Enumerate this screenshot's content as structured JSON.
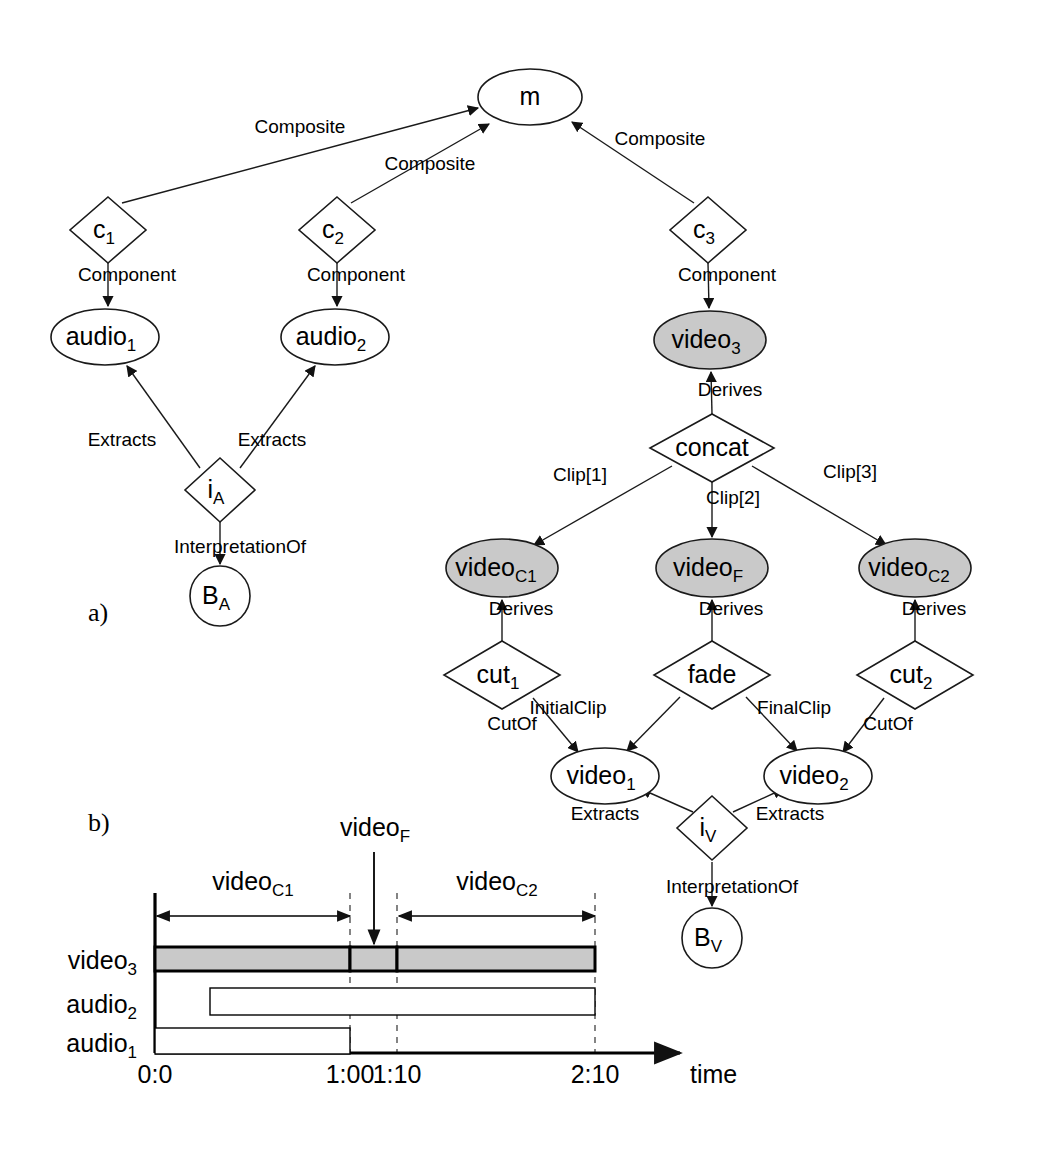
{
  "figure": {
    "panels": [
      {
        "id": "a",
        "label": "a)",
        "x": 88,
        "y": 598
      },
      {
        "id": "b",
        "label": "b)",
        "x": 88,
        "y": 808
      }
    ],
    "colors": {
      "stroke": "#1a1a1a",
      "node_fill_white": "#ffffff",
      "node_fill_gray": "#c9c9c9",
      "background": "#ffffff"
    }
  },
  "graph": {
    "nodes": [
      {
        "name": "m",
        "kind": "ellipse",
        "label": "m",
        "sub": "",
        "cx": 530,
        "cy": 97,
        "rx": 52,
        "ry": 28,
        "fill": "white"
      },
      {
        "name": "c1",
        "kind": "diamond",
        "label": "c",
        "sub": "1",
        "cx": 108,
        "cy": 230,
        "rx": 38,
        "ry": 33,
        "fill": "white"
      },
      {
        "name": "c2",
        "kind": "diamond",
        "label": "c",
        "sub": "2",
        "cx": 337,
        "cy": 230,
        "rx": 38,
        "ry": 33,
        "fill": "white"
      },
      {
        "name": "c3",
        "kind": "diamond",
        "label": "c",
        "sub": "3",
        "cx": 708,
        "cy": 230,
        "rx": 38,
        "ry": 33,
        "fill": "white"
      },
      {
        "name": "audio1",
        "kind": "ellipse",
        "label": "audio",
        "sub": "1",
        "cx": 105,
        "cy": 337,
        "rx": 54,
        "ry": 28,
        "fill": "white"
      },
      {
        "name": "audio2",
        "kind": "ellipse",
        "label": "audio",
        "sub": "2",
        "cx": 335,
        "cy": 337,
        "rx": 54,
        "ry": 28,
        "fill": "white"
      },
      {
        "name": "video3",
        "kind": "ellipse",
        "label": "video",
        "sub": "3",
        "cx": 710,
        "cy": 340,
        "rx": 56,
        "ry": 29,
        "fill": "gray"
      },
      {
        "name": "iA",
        "kind": "diamond",
        "label": "i",
        "sub": "A",
        "cx": 220,
        "cy": 490,
        "rx": 35,
        "ry": 32,
        "fill": "white"
      },
      {
        "name": "BA",
        "kind": "circle",
        "label": "B",
        "sub": "A",
        "cx": 220,
        "cy": 596,
        "rx": 30,
        "ry": 30,
        "fill": "white"
      },
      {
        "name": "concat",
        "kind": "diamond",
        "label": "concat",
        "sub": "",
        "cx": 712,
        "cy": 448,
        "rx": 62,
        "ry": 34,
        "fill": "white"
      },
      {
        "name": "videoC1",
        "kind": "ellipse",
        "label": "video",
        "sub": "C1",
        "cx": 502,
        "cy": 568,
        "rx": 56,
        "ry": 29,
        "fill": "gray"
      },
      {
        "name": "videoF",
        "kind": "ellipse",
        "label": "video",
        "sub": "F",
        "cx": 712,
        "cy": 568,
        "rx": 56,
        "ry": 29,
        "fill": "gray"
      },
      {
        "name": "videoC2",
        "kind": "ellipse",
        "label": "video",
        "sub": "C2",
        "cx": 915,
        "cy": 568,
        "rx": 56,
        "ry": 29,
        "fill": "gray"
      },
      {
        "name": "cut1",
        "kind": "diamond",
        "label": "cut",
        "sub": "1",
        "cx": 502,
        "cy": 675,
        "rx": 58,
        "ry": 34,
        "fill": "white"
      },
      {
        "name": "fade",
        "kind": "diamond",
        "label": "fade",
        "sub": "",
        "cx": 712,
        "cy": 675,
        "rx": 58,
        "ry": 34,
        "fill": "white"
      },
      {
        "name": "cut2",
        "kind": "diamond",
        "label": "cut",
        "sub": "2",
        "cx": 915,
        "cy": 675,
        "rx": 58,
        "ry": 34,
        "fill": "white"
      },
      {
        "name": "video1",
        "kind": "ellipse",
        "label": "video",
        "sub": "1",
        "cx": 605,
        "cy": 776,
        "rx": 54,
        "ry": 28,
        "fill": "white"
      },
      {
        "name": "video2",
        "kind": "ellipse",
        "label": "video",
        "sub": "2",
        "cx": 818,
        "cy": 776,
        "rx": 54,
        "ry": 28,
        "fill": "white"
      },
      {
        "name": "iV",
        "kind": "diamond",
        "label": "i",
        "sub": "V",
        "cx": 712,
        "cy": 828,
        "rx": 35,
        "ry": 32,
        "fill": "white"
      },
      {
        "name": "BV",
        "kind": "circle",
        "label": "B",
        "sub": "V",
        "cx": 712,
        "cy": 938,
        "rx": 30,
        "ry": 30,
        "fill": "white"
      }
    ],
    "edges": [
      {
        "from": "c1",
        "to": "m",
        "label": "Composite",
        "lx": 300,
        "ly": 133,
        "x1": 122,
        "y1": 203,
        "x2": 478,
        "y2": 108
      },
      {
        "from": "c2",
        "to": "m",
        "label": "Composite",
        "lx": 430,
        "ly": 170,
        "x1": 351,
        "y1": 203,
        "x2": 489,
        "y2": 124
      },
      {
        "from": "c3",
        "to": "m",
        "label": "Composite",
        "lx": 660,
        "ly": 145,
        "x1": 694,
        "y1": 203,
        "x2": 572,
        "y2": 122
      },
      {
        "from": "c1",
        "to": "audio1",
        "label": "Component",
        "lx": 127,
        "ly": 281,
        "x1": 108,
        "y1": 263,
        "x2": 108,
        "y2": 306
      },
      {
        "from": "c2",
        "to": "audio2",
        "label": "Component",
        "lx": 356,
        "ly": 281,
        "x1": 337,
        "y1": 263,
        "x2": 337,
        "y2": 306
      },
      {
        "from": "c3",
        "to": "video3",
        "label": "Component",
        "lx": 727,
        "ly": 281,
        "x1": 708,
        "y1": 263,
        "x2": 709,
        "y2": 308
      },
      {
        "from": "iA",
        "to": "audio1",
        "label": "Extracts",
        "lx": 122,
        "ly": 446,
        "x1": 200,
        "y1": 468,
        "x2": 127,
        "y2": 366
      },
      {
        "from": "iA",
        "to": "audio2",
        "label": "Extracts",
        "lx": 272,
        "ly": 446,
        "x1": 240,
        "y1": 468,
        "x2": 315,
        "y2": 366
      },
      {
        "from": "iA",
        "to": "BA",
        "label": "InterpretationOf",
        "lx": 240,
        "ly": 553,
        "x1": 220,
        "y1": 522,
        "x2": 220,
        "y2": 564
      },
      {
        "from": "concat",
        "to": "video3",
        "label": "Derives",
        "lx": 730,
        "ly": 396,
        "x1": 712,
        "y1": 414,
        "x2": 711,
        "y2": 372
      },
      {
        "from": "concat",
        "to": "videoC1",
        "label": "Clip[1]",
        "lx": 580,
        "ly": 481,
        "x1": 672,
        "y1": 466,
        "x2": 534,
        "y2": 545
      },
      {
        "from": "concat",
        "to": "videoF",
        "label": "Clip[2]",
        "lx": 733,
        "ly": 504,
        "x1": 712,
        "y1": 482,
        "x2": 712,
        "y2": 537
      },
      {
        "from": "concat",
        "to": "videoC2",
        "label": "Clip[3]",
        "lx": 850,
        "ly": 478,
        "x1": 752,
        "y1": 466,
        "x2": 886,
        "y2": 545
      },
      {
        "from": "cut1",
        "to": "videoC1",
        "label": "Derives",
        "lx": 521,
        "ly": 615,
        "x1": 502,
        "y1": 641,
        "x2": 502,
        "y2": 600
      },
      {
        "from": "fade",
        "to": "videoF",
        "label": "Derives",
        "lx": 731,
        "ly": 615,
        "x1": 712,
        "y1": 641,
        "x2": 712,
        "y2": 600
      },
      {
        "from": "cut2",
        "to": "videoC2",
        "label": "Derives",
        "lx": 934,
        "ly": 615,
        "x1": 915,
        "y1": 641,
        "x2": 915,
        "y2": 600
      },
      {
        "from": "cut1",
        "to": "video1",
        "label": "CutOf",
        "lx": 512,
        "ly": 730,
        "x1": 533,
        "y1": 698,
        "x2": 578,
        "y2": 752
      },
      {
        "from": "fade",
        "to": "video1",
        "label": "InitialClip",
        "lx": 568,
        "ly": 714,
        "x1": 680,
        "y1": 697,
        "x2": 627,
        "y2": 751
      },
      {
        "from": "fade",
        "to": "video2",
        "label": "FinalClip",
        "lx": 794,
        "ly": 714,
        "x1": 746,
        "y1": 697,
        "x2": 797,
        "y2": 751
      },
      {
        "from": "cut2",
        "to": "video2",
        "label": "CutOf",
        "lx": 888,
        "ly": 730,
        "x1": 884,
        "y1": 698,
        "x2": 843,
        "y2": 752
      },
      {
        "from": "iV",
        "to": "video1",
        "label": "Extracts",
        "lx": 605,
        "ly": 820,
        "x1": 693,
        "y1": 812,
        "x2": 641,
        "y2": 789
      },
      {
        "from": "iV",
        "to": "video2",
        "label": "Extracts",
        "lx": 790,
        "ly": 820,
        "x1": 733,
        "y1": 812,
        "x2": 783,
        "y2": 789
      },
      {
        "from": "iV",
        "to": "BV",
        "label": "InterpretationOf",
        "lx": 732,
        "ly": 893,
        "x1": 712,
        "y1": 862,
        "x2": 712,
        "y2": 906
      }
    ]
  },
  "timeline": {
    "axis": {
      "origin_x": 155,
      "baseline_y": 1053,
      "top_y": 893,
      "arrow_end_x": 680,
      "time_label": "time"
    },
    "ticks": [
      {
        "label": "0:0",
        "x": 155
      },
      {
        "label": "1:00",
        "x": 350
      },
      {
        "label": "1:10",
        "x": 397
      },
      {
        "label": "2:10",
        "x": 595
      }
    ],
    "rows": [
      {
        "label": "video",
        "sub": "3",
        "y": 947,
        "height": 24
      },
      {
        "label": "audio",
        "sub": "2",
        "y": 988,
        "height": 27
      },
      {
        "label": "audio",
        "sub": "1",
        "y": 1028,
        "height": 26
      }
    ],
    "bars": [
      {
        "row": "video3",
        "x1": 155,
        "x2": 350,
        "fill": "gray"
      },
      {
        "row": "video3",
        "x1": 350,
        "x2": 397,
        "fill": "gray"
      },
      {
        "row": "video3",
        "x1": 397,
        "x2": 595,
        "fill": "gray"
      },
      {
        "row": "audio2",
        "x1": 210,
        "x2": 595,
        "fill": "white"
      },
      {
        "row": "audio1",
        "x1": 155,
        "x2": 350,
        "fill": "white"
      }
    ],
    "spans": [
      {
        "label": "video",
        "sub": "C1",
        "x1": 157,
        "x2": 350,
        "y": 916,
        "label_x": 253,
        "label_y": 890
      },
      {
        "label": "video",
        "sub": "C2",
        "x1": 399,
        "x2": 595,
        "y": 916,
        "label_x": 497,
        "label_y": 890
      }
    ],
    "pointer": {
      "label": "video",
      "sub": "F",
      "label_x": 375,
      "label_y": 836,
      "x": 374,
      "y1": 852,
      "y2": 944
    },
    "guides": [
      350,
      397,
      595
    ]
  }
}
